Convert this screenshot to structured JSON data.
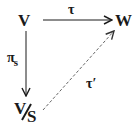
{
  "diagram": {
    "type": "commutative-diagram",
    "nodes": {
      "top_left": "V",
      "top_right": "W",
      "bottom_left": {
        "numerator": "V",
        "denominator": "S"
      }
    },
    "arrows": {
      "horizontal": {
        "from": "V",
        "to": "W",
        "label": "τ",
        "style": "solid"
      },
      "vertical": {
        "from": "V",
        "to": "V/S",
        "label_main": "π",
        "label_sub": "s",
        "style": "solid"
      },
      "diagonal": {
        "from": "V/S",
        "to": "W",
        "label": "τ′",
        "style": "dashed"
      }
    },
    "colors": {
      "ink": "#1a1a1a",
      "dashed": "#555555",
      "background": "#ffffff"
    }
  }
}
